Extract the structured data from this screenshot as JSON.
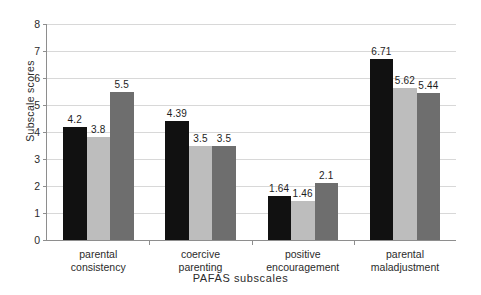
{
  "chart_data": {
    "type": "bar",
    "title": "",
    "xlabel": "PAFAS subscales",
    "ylabel": "Subscale scores",
    "ylim": [
      0,
      8
    ],
    "ytick_values": [
      0,
      1,
      2,
      3,
      4,
      5,
      6,
      7,
      8
    ],
    "ytick_labels": [
      "0",
      "1",
      "2",
      "3",
      "4",
      "5",
      "6",
      "7",
      "8"
    ],
    "grid": true,
    "legend": "none",
    "categories": [
      "parental consistency",
      "coercive parenting",
      "positive encouragement",
      "parental maladjustment"
    ],
    "category_lines": [
      [
        "parental",
        "consistency"
      ],
      [
        "coercive",
        "parenting"
      ],
      [
        "positive",
        "encouragement"
      ],
      [
        "parental",
        "maladjustment"
      ]
    ],
    "series": [
      {
        "name": "series-1",
        "color": "#111111",
        "values": [
          4.2,
          4.39,
          1.64,
          6.71
        ],
        "labels": [
          "4.2",
          "4.39",
          "1.64",
          "6.71"
        ]
      },
      {
        "name": "series-2",
        "color": "#bdbdbd",
        "values": [
          3.8,
          3.5,
          1.46,
          5.62
        ],
        "labels": [
          "3.8",
          "3.5",
          "1.46",
          "5.62"
        ]
      },
      {
        "name": "series-3",
        "color": "#6e6e6e",
        "values": [
          5.5,
          3.5,
          2.1,
          5.44
        ],
        "labels": [
          "5.5",
          "3.5",
          "2.1",
          "5.44"
        ]
      }
    ]
  },
  "colors": {
    "background": "#ffffff",
    "axis": "#8e8e8e",
    "gridline": "#d8d8d8",
    "text": "#2b2b2b",
    "series_1": "#111111",
    "series_2": "#bdbdbd",
    "series_3": "#6e6e6e"
  }
}
